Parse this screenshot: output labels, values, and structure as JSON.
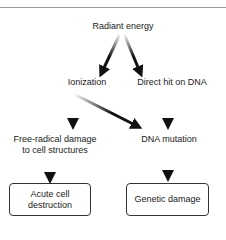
{
  "diagram": {
    "nodes": {
      "radiant_energy": "Radiant energy",
      "ionization": "Ionization",
      "direct_hit": "Direct hit on DNA",
      "free_radical_line1": "Free-radical damage",
      "free_radical_line2": "to cell structures",
      "dna_mutation": "DNA mutation",
      "acute_line1": "Acute cell",
      "acute_line2": "destruction",
      "genetic_damage": "Genetic damage"
    },
    "edges": [
      {
        "from": "Radiant energy",
        "to": "Ionization"
      },
      {
        "from": "Radiant energy",
        "to": "Direct hit on DNA"
      },
      {
        "from": "Ionization",
        "to": "Free-radical damage to cell structures"
      },
      {
        "from": "Ionization",
        "to": "DNA mutation"
      },
      {
        "from": "Direct hit on DNA",
        "to": "DNA mutation"
      },
      {
        "from": "Free-radical damage to cell structures",
        "to": "Acute cell destruction"
      },
      {
        "from": "DNA mutation",
        "to": "Genetic damage"
      }
    ]
  }
}
